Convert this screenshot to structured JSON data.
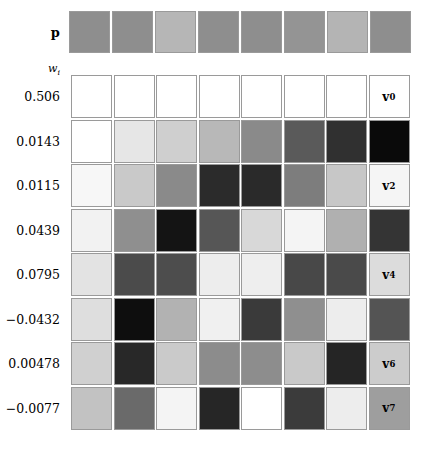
{
  "figure": {
    "mean_row": {
      "label": "p",
      "cells": [
        "#8e8e8e",
        "#8e8e8e",
        "#b6b6b6",
        "#8e8e8e",
        "#8e8e8e",
        "#949494",
        "#b4b4b4",
        "#8e8e8e"
      ]
    },
    "weights_header": "w",
    "weights_header_sub": "i",
    "rows": [
      {
        "weight": "0.506",
        "vector_label": "v",
        "vector_sub": "0",
        "label_visible": true,
        "cells": [
          "#ffffff",
          "#ffffff",
          "#ffffff",
          "#ffffff",
          "#ffffff",
          "#ffffff",
          "#ffffff",
          "#ffffff"
        ]
      },
      {
        "weight": "0.0143",
        "vector_label": "v",
        "vector_sub": "1",
        "label_visible": false,
        "cells": [
          "#ffffff",
          "#e6e6e6",
          "#cfcfcf",
          "#b8b8b8",
          "#8a8a8a",
          "#5a5a5a",
          "#303030",
          "#0a0a0a"
        ]
      },
      {
        "weight": "0.0115",
        "vector_label": "v",
        "vector_sub": "2",
        "label_visible": true,
        "cells": [
          "#f7f7f7",
          "#c9c9c9",
          "#8a8a8a",
          "#2b2b2b",
          "#2a2a2a",
          "#7d7d7d",
          "#c7c7c7",
          "#f5f5f5"
        ]
      },
      {
        "weight": "0.0439",
        "vector_label": "v",
        "vector_sub": "3",
        "label_visible": false,
        "cells": [
          "#f2f2f2",
          "#8f8f8f",
          "#141414",
          "#565656",
          "#d8d8d8",
          "#f4f4f4",
          "#b0b0b0",
          "#343434"
        ]
      },
      {
        "weight": "0.0795",
        "vector_label": "v",
        "vector_sub": "4",
        "label_visible": true,
        "cells": [
          "#e3e3e3",
          "#4b4b4b",
          "#4d4d4d",
          "#ededed",
          "#eeeeee",
          "#484848",
          "#4a4a4a",
          "#dcdcdc"
        ]
      },
      {
        "weight": "−0.0432",
        "vector_label": "v",
        "vector_sub": "5",
        "label_visible": false,
        "cells": [
          "#dedede",
          "#0e0e0e",
          "#b2b2b2",
          "#f0f0f0",
          "#3a3a3a",
          "#8f8f8f",
          "#ededed",
          "#545454"
        ]
      },
      {
        "weight": "0.00478",
        "vector_label": "v",
        "vector_sub": "6",
        "label_visible": true,
        "cells": [
          "#d0d0d0",
          "#282828",
          "#cacaca",
          "#8c8c8c",
          "#8d8d8d",
          "#c9c9c9",
          "#252525",
          "#cccccc"
        ]
      },
      {
        "weight": "−0.0077",
        "vector_label": "v",
        "vector_sub": "7",
        "label_visible": true,
        "cells": [
          "#c2c2c2",
          "#6a6a6a",
          "#f4f4f4",
          "#262626",
          "#ffffff",
          "#3b3b3b",
          "#ededed",
          "#9e9e9e"
        ]
      }
    ]
  }
}
